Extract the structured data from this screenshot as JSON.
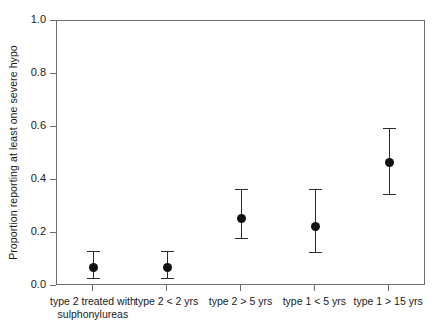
{
  "chart_data": {
    "type": "scatter",
    "title": "",
    "subtitle": "",
    "xlabel": "",
    "ylabel": "Proportion reporting at least one severe hypo",
    "ylim": [
      0.0,
      1.0
    ],
    "yticks": [
      "0.0",
      "0.2",
      "0.4",
      "0.6",
      "0.8",
      "1.0"
    ],
    "ytick_values": [
      0.0,
      0.2,
      0.4,
      0.6,
      0.8,
      1.0
    ],
    "grid": false,
    "legend": null,
    "marker_color": "#111111",
    "errorbar_color": "#2b2b2b",
    "axis_color": "#6e6e6e",
    "categories": [
      "type 2 treated with\nsulphonylureas",
      "type 2 < 2 yrs",
      "type 2 > 5 yrs",
      "type 1 < 5 yrs",
      "type 1 > 15 yrs"
    ],
    "values": [
      0.07,
      0.07,
      0.255,
      0.225,
      0.465
    ],
    "ci_lower": [
      0.03,
      0.03,
      0.18,
      0.125,
      0.345
    ],
    "ci_upper": [
      0.13,
      0.13,
      0.365,
      0.365,
      0.595
    ],
    "points": [
      {
        "category": "type 2 treated with sulphonylureas",
        "value": 0.07,
        "lower": 0.03,
        "upper": 0.13
      },
      {
        "category": "type 2 < 2 yrs",
        "value": 0.07,
        "lower": 0.03,
        "upper": 0.13
      },
      {
        "category": "type 2 > 5 yrs",
        "value": 0.255,
        "lower": 0.18,
        "upper": 0.365
      },
      {
        "category": "type 1 < 5 yrs",
        "value": 0.225,
        "lower": 0.125,
        "upper": 0.365
      },
      {
        "category": "type 1 > 15 yrs",
        "value": 0.465,
        "lower": 0.345,
        "upper": 0.595
      }
    ]
  }
}
